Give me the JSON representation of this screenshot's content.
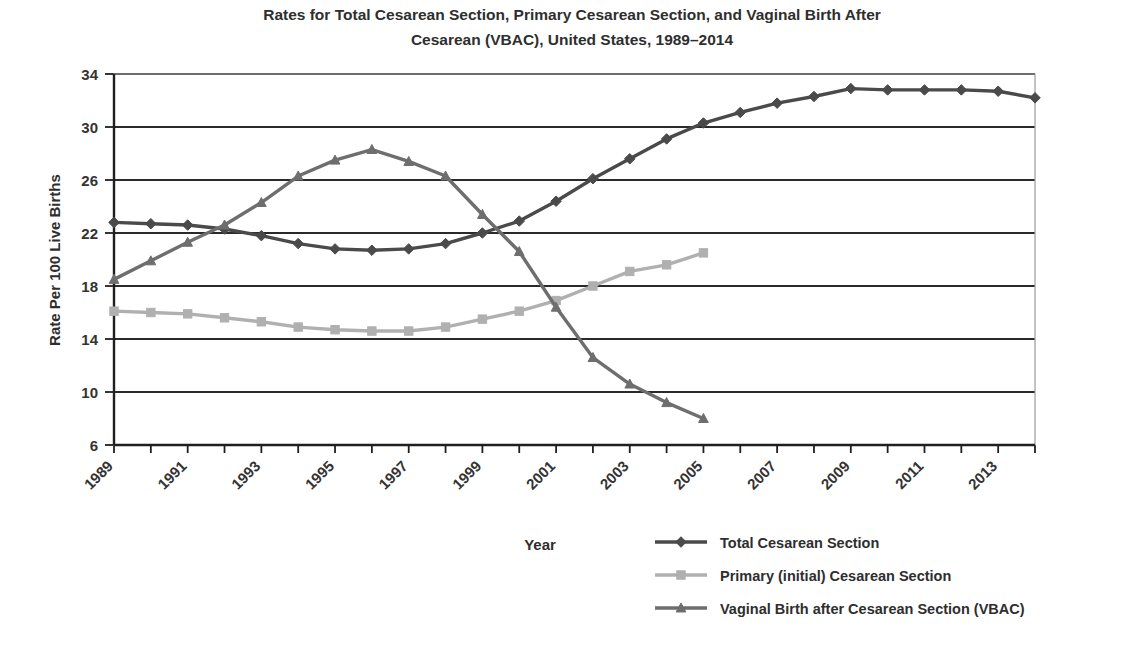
{
  "chart_data": {
    "type": "line",
    "title": "Rates for Total Cesarean Section, Primary Cesarean Section, and Vaginal Birth After Cesarean (VBAC), United States, 1989–2014",
    "title_line1": "Rates for Total Cesarean Section, Primary Cesarean Section, and Vaginal Birth After",
    "title_line2": "Cesarean (VBAC), United States, 1989–2014",
    "xlabel": "Year",
    "ylabel": "Rate Per 100 Live Births",
    "grid": "horizontal",
    "legend_position": "bottom-right",
    "ylim": [
      6,
      34
    ],
    "ytick_step": 4,
    "yticks": [
      6,
      10,
      14,
      18,
      22,
      26,
      30,
      34
    ],
    "ytick_labels": [
      "6",
      "10",
      "14",
      "18",
      "22",
      "26",
      "30",
      "34"
    ],
    "x": [
      1989,
      1990,
      1991,
      1992,
      1993,
      1994,
      1995,
      1996,
      1997,
      1998,
      1999,
      2000,
      2001,
      2002,
      2003,
      2004,
      2005,
      2006,
      2007,
      2008,
      2009,
      2010,
      2011,
      2012,
      2013,
      2014
    ],
    "xtick_labels_shown": [
      "1989",
      "1991",
      "1993",
      "1995",
      "1997",
      "1999",
      "2001",
      "2003",
      "2005",
      "2007",
      "2009",
      "2011",
      "2013"
    ],
    "xlim": [
      1989,
      2014
    ],
    "series": [
      {
        "name": "Total Cesarean Section",
        "color": "#4a4a4a",
        "marker": "diamond",
        "values": [
          22.8,
          22.7,
          22.6,
          22.3,
          21.8,
          21.2,
          20.8,
          20.7,
          20.8,
          21.2,
          22.0,
          22.9,
          24.4,
          26.1,
          27.6,
          29.1,
          30.3,
          31.1,
          31.8,
          32.3,
          32.9,
          32.8,
          32.8,
          32.8,
          32.7,
          32.2
        ]
      },
      {
        "name": "Primary (initial) Cesarean Section",
        "color": "#b0b0b0",
        "marker": "square",
        "values": [
          16.1,
          16.0,
          15.9,
          15.6,
          15.3,
          14.9,
          14.7,
          14.6,
          14.6,
          14.9,
          15.5,
          16.1,
          16.9,
          18.0,
          19.1,
          19.6,
          20.5,
          null,
          null,
          null,
          null,
          null,
          null,
          null,
          null,
          null
        ]
      },
      {
        "name": "Vaginal Birth after Cesarean Section (VBAC)",
        "color": "#6e6e6e",
        "marker": "triangle",
        "values": [
          18.5,
          19.9,
          21.3,
          22.6,
          24.3,
          26.3,
          27.5,
          28.3,
          27.4,
          26.3,
          23.4,
          20.6,
          16.4,
          12.6,
          10.6,
          9.2,
          8.0,
          null,
          null,
          null,
          null,
          null,
          null,
          null,
          null,
          null
        ]
      }
    ]
  },
  "legend": {
    "items": [
      {
        "label": "Total Cesarean Section"
      },
      {
        "label": "Primary (initial) Cesarean Section"
      },
      {
        "label": "Vaginal Birth after Cesarean Section (VBAC)"
      }
    ]
  }
}
